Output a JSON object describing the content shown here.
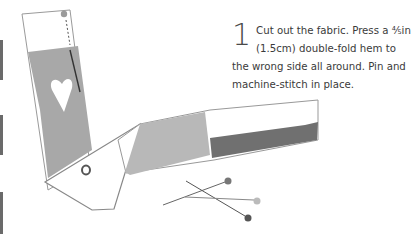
{
  "instruction": {
    "step_number": "1",
    "text": "Cut out the fabric. Press a ⅘in (1.5cm) double-fold hem to the wrong side all around. Pin and machine-stitch in place."
  },
  "illustration": {
    "subject": "fabric-strip-with-pins",
    "colors": {
      "fabric_light": "#a9a9a9",
      "fabric_dark": "#6f6f6f",
      "outline": "#8a8a8a",
      "pin": "#555555"
    }
  }
}
